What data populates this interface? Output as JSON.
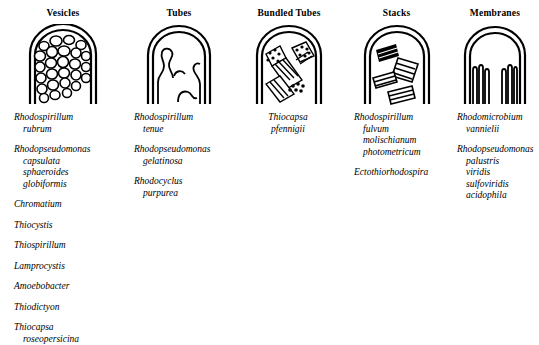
{
  "figure": {
    "ink_color": "#000000",
    "background_color": "#ffffff"
  },
  "columns": [
    {
      "title": "Vesicles",
      "diagram_name": "vesicles-cell-diagram",
      "diagram_description": "Rod-shaped cell with domed cap filled with many irregular spherical vesicles",
      "taxa": [
        {
          "genus": "Rhodospirillum",
          "species": [
            "rubrum"
          ]
        },
        {
          "genus": "Rhodopseudomonas",
          "species": [
            "capsulata",
            "sphaeroides",
            "globiformis"
          ]
        },
        {
          "genus": "Chromatium",
          "species": []
        },
        {
          "genus": "Thiocystis",
          "species": []
        },
        {
          "genus": "Thiospirillum",
          "species": []
        },
        {
          "genus": "Lamprocystis",
          "species": []
        },
        {
          "genus": "Amoebobacter",
          "species": []
        },
        {
          "genus": "Thiodictyon",
          "species": []
        },
        {
          "genus": "Thiocapsa",
          "species": [
            "roseopersicina"
          ]
        }
      ]
    },
    {
      "title": "Tubes",
      "diagram_name": "tubes-cell-diagram",
      "diagram_description": "Rod-shaped cell with domed cap containing wavy finger-like tubular invaginations",
      "taxa": [
        {
          "genus": "Rhodospirillum",
          "species": [
            "tenue"
          ]
        },
        {
          "genus": "Rhodopseudomonas",
          "species": [
            "gelatinosa"
          ]
        },
        {
          "genus": "Rhodocyclus",
          "species": [
            "purpurea"
          ]
        }
      ]
    },
    {
      "title": "Bundled Tubes",
      "diagram_name": "bundled-tubes-cell-diagram",
      "diagram_description": "Rod-shaped cell with domed cap containing hatched bundles of parallel tubes with dotted end-on cross sections",
      "centered": true,
      "taxa": [
        {
          "genus": "Thiocapsa",
          "species": [
            "pfennigii"
          ]
        }
      ]
    },
    {
      "title": "Stacks",
      "diagram_name": "stacks-cell-diagram",
      "diagram_description": "Rod-shaped cell with domed cap containing stacks of parallel lamellar membrane sheets at varied angles",
      "taxa": [
        {
          "genus": "Rhodospirillum",
          "species": [
            "fulvum",
            "molischianum",
            "photometricum"
          ]
        },
        {
          "genus": "Ectothiorhodospira",
          "species": []
        }
      ]
    },
    {
      "title": "Membranes",
      "diagram_name": "membranes-cell-diagram",
      "diagram_description": "Rod-shaped cell with domed cap with concentric lamellar membranes lining the cell periphery",
      "taxa": [
        {
          "genus": "Rhodomicrobium",
          "species": [
            "vannielii"
          ]
        },
        {
          "genus": "Rhodopseudomonas",
          "species": [
            "palustris",
            "viridis",
            "sulfoviridis",
            "acidophila"
          ]
        }
      ]
    }
  ]
}
